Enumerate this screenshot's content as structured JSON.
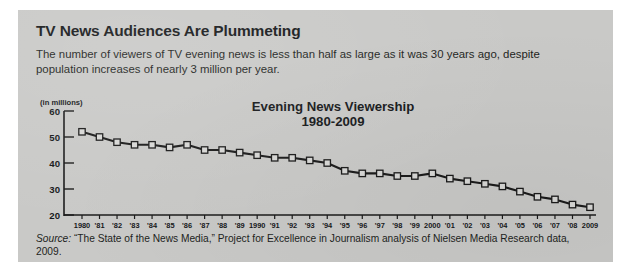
{
  "headline": "TV News Audiences Are Plummeting",
  "deck": "The number of viewers of TV evening news is less than half as large as it was 30 years ago, despite population increases of nearly 3 million per year.",
  "axis_unit_label": "(in millions)",
  "source": {
    "label": "Source:",
    "text": " “The State of the News Media,” Project for Excellence in Journalism analysis of Nielsen Media Research data, 2009."
  },
  "colors": {
    "panel_background": "#c9c9c7",
    "page_background": "#ffffff",
    "text": "#16181a",
    "line": "#1b1b1b",
    "marker_face": "#d8d8d6",
    "marker_edge": "#1b1b1b",
    "axis": "#1b1b1b"
  },
  "chart_data": {
    "type": "line",
    "title": "Evening News Viewership",
    "subtitle": "1980-2009",
    "xlabel": "",
    "ylabel": "(in millions)",
    "ylim": [
      20,
      60
    ],
    "yticks": [
      20,
      30,
      40,
      50,
      60
    ],
    "ytick_labels": [
      "20",
      "30",
      "40",
      "50",
      "60"
    ],
    "grid": false,
    "legend": "none",
    "x": [
      1980,
      1981,
      1982,
      1983,
      1984,
      1985,
      1986,
      1987,
      1988,
      1989,
      1990,
      1991,
      1992,
      1993,
      1994,
      1995,
      1996,
      1997,
      1998,
      1999,
      2000,
      2001,
      2002,
      2003,
      2004,
      2005,
      2006,
      2007,
      2008,
      2009
    ],
    "xtick_labels": [
      "1980",
      "'81",
      "'82",
      "'83",
      "'84",
      "'85",
      "'86",
      "'87",
      "'88",
      "'89",
      "1990",
      "'91",
      "'92",
      "'93",
      "'94",
      "'95",
      "'96",
      "'97",
      "'98",
      "'99",
      "2000",
      "'01",
      "'02",
      "'03",
      "'04",
      "'05",
      "'06",
      "'07",
      "'08",
      "2009"
    ],
    "values": [
      52,
      50,
      48,
      47,
      47,
      46,
      47,
      45,
      45,
      44,
      43,
      42,
      42,
      41,
      40,
      37,
      36,
      36,
      35,
      35,
      36,
      34,
      33,
      32,
      31,
      29,
      27,
      26,
      24,
      23
    ],
    "series": [
      {
        "name": "Evening news viewership (millions)",
        "values": [
          52,
          50,
          48,
          47,
          47,
          46,
          47,
          45,
          45,
          44,
          43,
          42,
          42,
          41,
          40,
          37,
          36,
          36,
          35,
          35,
          36,
          34,
          33,
          32,
          31,
          29,
          27,
          26,
          24,
          23
        ]
      }
    ],
    "marker": "square"
  }
}
